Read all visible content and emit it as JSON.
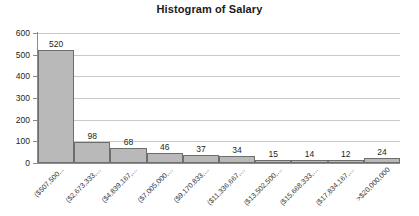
{
  "chart": {
    "title": "Histogram of Salary"
  },
  "chart_data": {
    "type": "bar",
    "title": "Histogram of Salary",
    "xlabel": "",
    "ylabel": "",
    "ylim": [
      0,
      600
    ],
    "grid": true,
    "legend": false,
    "yticks": [
      600,
      500,
      400,
      300,
      200,
      100,
      0
    ],
    "categories": [
      "($507,500...",
      "($2,673,333,...",
      "($4,839,167,...",
      "($7,005,000,...",
      "($9,170,833,...",
      "($11,336,667,...",
      "($13,502,500,...",
      "($15,668,333,...",
      "($17,834,167,...",
      ">$20,000,000"
    ],
    "values": [
      520,
      98,
      68,
      46,
      37,
      34,
      15,
      14,
      12,
      24
    ],
    "bar_color": "#b9b9b9",
    "bar_border_color": "#6e6e6e",
    "gridline_color": "#c9c9c9",
    "axis_color": "#8a8a8a"
  }
}
